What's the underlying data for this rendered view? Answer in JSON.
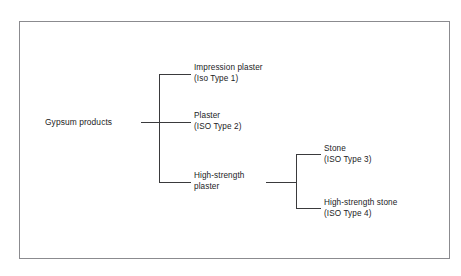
{
  "diagram": {
    "colors": {
      "background": "#ffffff",
      "frame_border": "#8b8b8f",
      "line": "#3a3a3c",
      "text": "#1b1b1d"
    },
    "root": {
      "label": "Gypsum products"
    },
    "branch_1": [
      {
        "name": "impression-plaster",
        "title": "Impression plaster",
        "subtitle": "(Iso Type 1)"
      },
      {
        "name": "plaster",
        "title": "Plaster",
        "subtitle": "(ISO Type 2)"
      },
      {
        "name": "high-strength-plaster",
        "title": "High-strength",
        "subtitle": "plaster"
      }
    ],
    "branch_2": [
      {
        "name": "stone",
        "title": "Stone",
        "subtitle": "(ISO Type 3)"
      },
      {
        "name": "high-strength-stone",
        "title": "High-strength stone",
        "subtitle": "(ISO Type 4)"
      }
    ]
  }
}
